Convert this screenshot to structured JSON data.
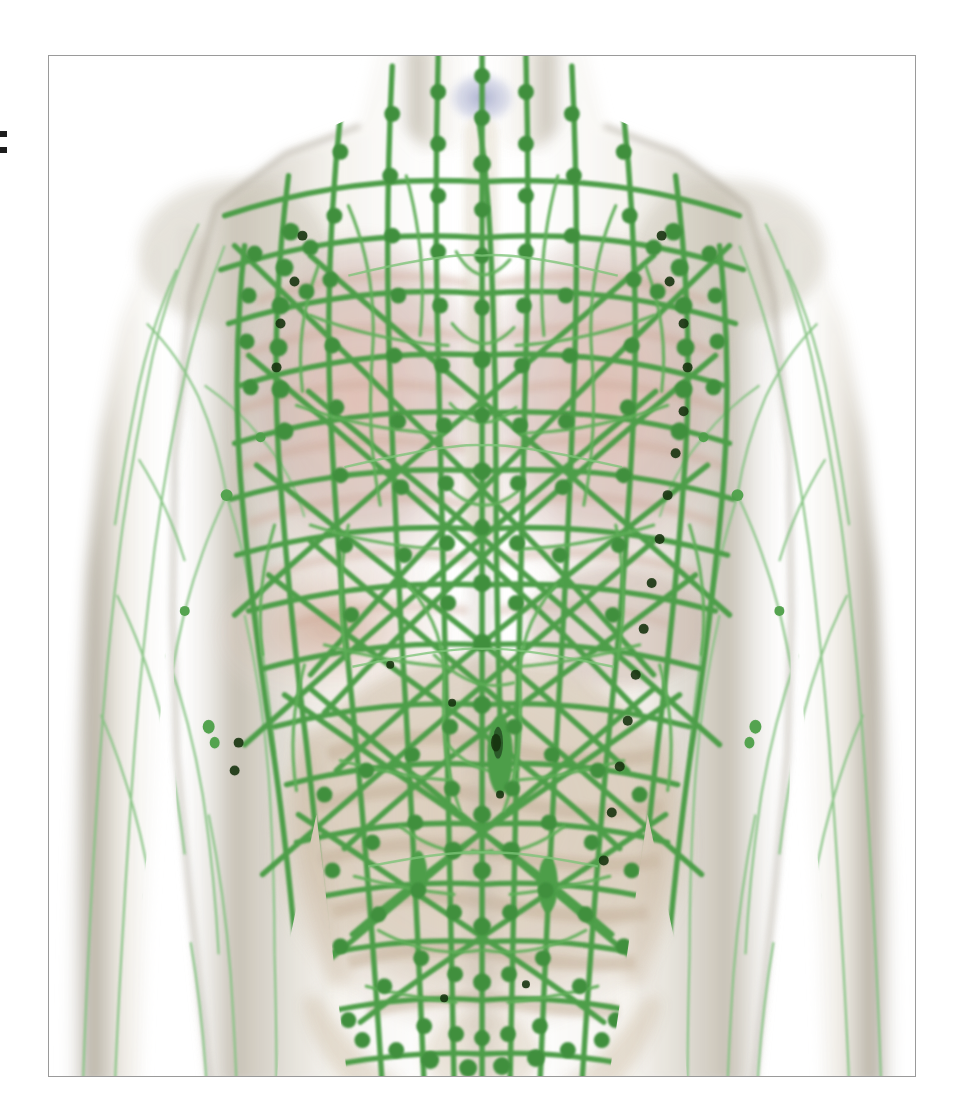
{
  "page": {
    "background_color": "#ffffff",
    "margin_artifact": "▪▪"
  },
  "figure": {
    "frame_color": "#9a9a9a",
    "background_color": "#ffffff",
    "caption": "",
    "view": "anterior"
  },
  "colors": {
    "lymph_vessel": "#4e9e4a",
    "lymph_vessel_light": "#8cc98a",
    "lymph_node": "#3f8f3d",
    "lymph_node_dark": "#1d3f1c",
    "skin_silhouette": "#cfcabd",
    "skin_silhouette_edge": "#a9a396",
    "muscle_pink": "#d8a393",
    "lung_tissue": "#c9b3ad",
    "bone_bone": "#e2d8c9",
    "intestine_tan": "#cbb8a2",
    "thyroid_blue": "#b9bcd4",
    "liver_brown": "#b8917e"
  },
  "anatomy": {
    "structures": [
      {
        "name": "cervical-lymph-nodes",
        "region": "neck",
        "label": "Cervical lymph nodes"
      },
      {
        "name": "thyroid-gland",
        "region": "neck",
        "label": "Thyroid gland"
      },
      {
        "name": "supraclavicular-nodes",
        "region": "upper-chest",
        "label": "Supraclavicular nodes"
      },
      {
        "name": "axillary-lymph-nodes-left",
        "region": "left-axilla",
        "label": "Axillary lymph nodes"
      },
      {
        "name": "axillary-lymph-nodes-right",
        "region": "right-axilla",
        "label": "Axillary lymph nodes"
      },
      {
        "name": "thoracic-duct",
        "region": "midline-thorax",
        "label": "Thoracic duct"
      },
      {
        "name": "mediastinal-nodes",
        "region": "thorax",
        "label": "Mediastinal lymph nodes"
      },
      {
        "name": "lungs",
        "region": "thorax",
        "label": "Lungs"
      },
      {
        "name": "diaphragm",
        "region": "mid-trunk",
        "label": "Diaphragm"
      },
      {
        "name": "liver",
        "region": "right-upper-abdomen",
        "label": "Liver"
      },
      {
        "name": "spleen",
        "region": "left-upper-abdomen",
        "label": "Spleen"
      },
      {
        "name": "cisterna-chyli",
        "region": "upper-abdomen-midline",
        "label": "Cisterna chyli"
      },
      {
        "name": "mesenteric-lymph-nodes",
        "region": "abdomen",
        "label": "Mesenteric lymph nodes"
      },
      {
        "name": "small-intestine",
        "region": "abdomen",
        "label": "Small intestine"
      },
      {
        "name": "lumbar-nodes",
        "region": "lower-abdomen",
        "label": "Lumbar lymph nodes"
      },
      {
        "name": "iliac-lymph-nodes",
        "region": "pelvis",
        "label": "Iliac lymph nodes"
      },
      {
        "name": "inguinal-lymph-nodes",
        "region": "groin",
        "label": "Inguinal lymph nodes"
      },
      {
        "name": "upper-limb-lymphatics-left",
        "region": "left-arm",
        "label": "Superficial arm lymphatics"
      },
      {
        "name": "upper-limb-lymphatics-right",
        "region": "right-arm",
        "label": "Superficial arm lymphatics"
      }
    ]
  }
}
